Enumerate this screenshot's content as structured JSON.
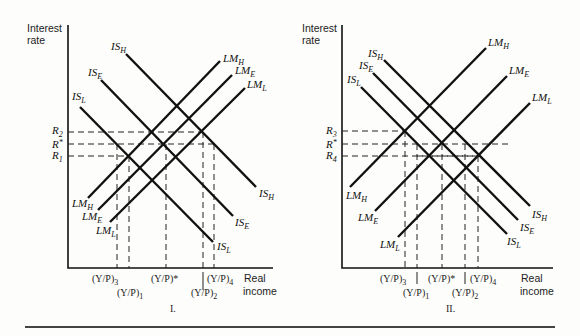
{
  "figure": {
    "panels": [
      {
        "id": "I",
        "caption": "I.",
        "y_axis_label": [
          "Interest",
          "rate"
        ],
        "x_axis_label": [
          "Real",
          "income"
        ],
        "rate_ticks": [
          {
            "base": "R",
            "sub": "2",
            "y": 132
          },
          {
            "base": "R",
            "sub": "*",
            "y": 144
          },
          {
            "base": "R",
            "sub": "1",
            "y": 156
          }
        ],
        "income_ticks_row1": [
          {
            "text": "(Y/P)",
            "sub": "3",
            "x": 117
          },
          {
            "text": "(Y/P)*",
            "sub": "",
            "x": 166
          },
          {
            "text": "(Y/P)",
            "sub": "4",
            "x": 214
          }
        ],
        "income_ticks_row2": [
          {
            "text": "(Y/P)",
            "sub": "1",
            "x": 129
          },
          {
            "text": "(Y/P)",
            "sub": "2",
            "x": 203
          }
        ],
        "curves": [
          {
            "name": "IS",
            "sub": "H"
          },
          {
            "name": "IS",
            "sub": "E"
          },
          {
            "name": "IS",
            "sub": "L"
          },
          {
            "name": "LM",
            "sub": "H"
          },
          {
            "name": "LM",
            "sub": "E"
          },
          {
            "name": "LM",
            "sub": "L"
          }
        ]
      },
      {
        "id": "II",
        "caption": "II.",
        "y_axis_label": [
          "Interest",
          "rate"
        ],
        "x_axis_label": [
          "Real",
          "income"
        ],
        "rate_ticks": [
          {
            "base": "R",
            "sub": "3",
            "y": 131
          },
          {
            "base": "R",
            "sub": "*",
            "y": 144
          },
          {
            "base": "R",
            "sub": "4",
            "y": 156
          }
        ],
        "income_ticks_row1": [
          {
            "text": "(Y/P)",
            "sub": "3",
            "x": 405
          },
          {
            "text": "(Y/P)*",
            "sub": "",
            "x": 442
          },
          {
            "text": "(Y/P)",
            "sub": "4",
            "x": 478
          }
        ],
        "income_ticks_row2": [
          {
            "text": "(Y/P)",
            "sub": "1",
            "x": 417
          },
          {
            "text": "(Y/P)",
            "sub": "2",
            "x": 465
          }
        ],
        "curves": [
          {
            "name": "IS",
            "sub": "H"
          },
          {
            "name": "IS",
            "sub": "E"
          },
          {
            "name": "IS",
            "sub": "L"
          },
          {
            "name": "LM",
            "sub": "H"
          },
          {
            "name": "LM",
            "sub": "E"
          },
          {
            "name": "LM",
            "sub": "L"
          }
        ]
      }
    ]
  },
  "labels": {
    "p1": {
      "interest": "Interest",
      "rate": "rate",
      "real": "Real",
      "income": "income",
      "caption": "I.",
      "R2": "R",
      "R2s": "2",
      "Rs": "R",
      "Rss": "*",
      "R1": "R",
      "R1s": "1",
      "YP": "(Y/P)",
      "YPstar": "(Y/P)*",
      "s3": "3",
      "s1": "1",
      "s2": "2",
      "s4": "4",
      "IS": "IS",
      "LM": "LM",
      "H": "H",
      "E": "E",
      "L": "L"
    },
    "p2": {
      "interest": "Interest",
      "rate": "rate",
      "real": "Real",
      "income": "income",
      "caption": "II.",
      "R3": "R",
      "R3s": "3",
      "Rs": "R",
      "Rss": "*",
      "R4": "R",
      "R4s": "4",
      "YP": "(Y/P)",
      "YPstar": "(Y/P)*",
      "s3": "3",
      "s1": "1",
      "s2": "2",
      "s4": "4",
      "IS": "IS",
      "LM": "LM",
      "H": "H",
      "E": "E",
      "L": "L"
    }
  }
}
